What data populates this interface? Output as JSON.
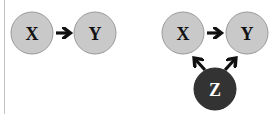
{
  "diagrams": [
    {
      "name": "direct-cause",
      "nodes": [
        {
          "id": "X",
          "label": "X",
          "cx": 32,
          "cy": 33,
          "r": 21,
          "fill": "#c9c9c9",
          "stroke": "#9a9a9a",
          "text_color": "#111111"
        },
        {
          "id": "Y",
          "label": "Y",
          "cx": 95,
          "cy": 33,
          "r": 21,
          "fill": "#c9c9c9",
          "stroke": "#9a9a9a",
          "text_color": "#111111"
        }
      ],
      "edges": [
        {
          "from": "X",
          "to": "Y"
        }
      ]
    },
    {
      "name": "confounded",
      "nodes": [
        {
          "id": "X",
          "label": "X",
          "cx": 183,
          "cy": 33,
          "r": 21,
          "fill": "#c9c9c9",
          "stroke": "#9a9a9a",
          "text_color": "#111111"
        },
        {
          "id": "Y",
          "label": "Y",
          "cx": 247,
          "cy": 33,
          "r": 21,
          "fill": "#c9c9c9",
          "stroke": "#9a9a9a",
          "text_color": "#111111"
        },
        {
          "id": "Z",
          "label": "Z",
          "cx": 215,
          "cy": 89,
          "r": 21,
          "fill": "#333333",
          "stroke": "#2a2a2a",
          "text_color": "#ffffff"
        }
      ],
      "edges": [
        {
          "from": "X",
          "to": "Y"
        },
        {
          "from": "Z",
          "to": "X"
        },
        {
          "from": "Z",
          "to": "Y"
        }
      ]
    }
  ],
  "colors": {
    "arrow": "#111111",
    "divider": "#c4c4c4"
  }
}
